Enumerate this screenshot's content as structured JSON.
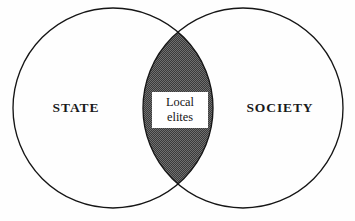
{
  "diagram": {
    "type": "venn",
    "title": "",
    "background_color": "#fefefe",
    "outline_color": "#151515",
    "intersection_fill_color": "#4a4a4a",
    "label_color": "#1a1a1a",
    "sets": [
      {
        "id": "state",
        "label": "STATE",
        "label_x": 76,
        "label_y": 109,
        "center_x": 113,
        "center_y": 108,
        "radius": 100
      },
      {
        "id": "society",
        "label": "SOCIETY",
        "label_x": 280,
        "label_y": 109,
        "center_x": 243,
        "center_y": 108,
        "radius": 100
      }
    ],
    "intersection": {
      "id": "local-elites",
      "label_line_1": "Local",
      "label_line_2": "elites",
      "box_x": 152,
      "box_y": 92,
      "box_width": 56,
      "box_height": 36,
      "fill_pattern": "stipple-dark"
    }
  }
}
